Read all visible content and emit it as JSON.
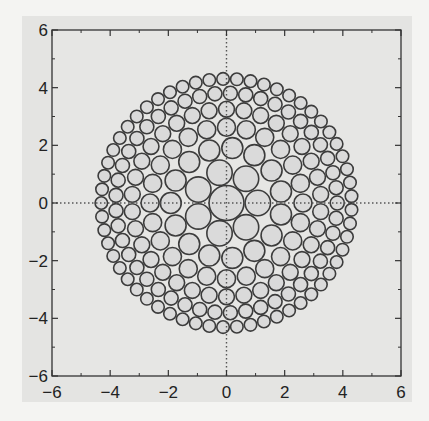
{
  "chart_data": {
    "type": "scatter",
    "subtype": "circle-packing",
    "title": "",
    "xlabel": "",
    "ylabel": "",
    "xlim": [
      -6,
      6
    ],
    "ylim": [
      -6,
      6
    ],
    "x_ticks": [
      -6,
      -4,
      -2,
      0,
      2,
      4,
      6
    ],
    "y_ticks": [
      -6,
      -4,
      -2,
      0,
      2,
      4,
      6
    ],
    "x_tick_labels": [
      "−6",
      "−4",
      "−2",
      "0",
      "2",
      "4",
      "6"
    ],
    "y_tick_labels": [
      "−6",
      "−4",
      "−2",
      "0",
      "2",
      "4",
      "6"
    ],
    "minor_ticks": [
      -5,
      -3,
      -1,
      1,
      3,
      5
    ],
    "grid": false,
    "reference_lines": {
      "x0": "dotted",
      "y0": "dotted"
    },
    "packing": {
      "outer_radius": 4.7,
      "center_circle_radius": 0.62,
      "edge_circle_radius": 0.22,
      "description": "Disk of circles; largest at center (r≈0.62) shrinking toward the rim (r≈0.22)"
    },
    "colors": {
      "circle_fill": "#dadada",
      "circle_stroke": "#3c3c3c",
      "plot_bg": "#e6e6e4",
      "axis": "#333333"
    }
  }
}
